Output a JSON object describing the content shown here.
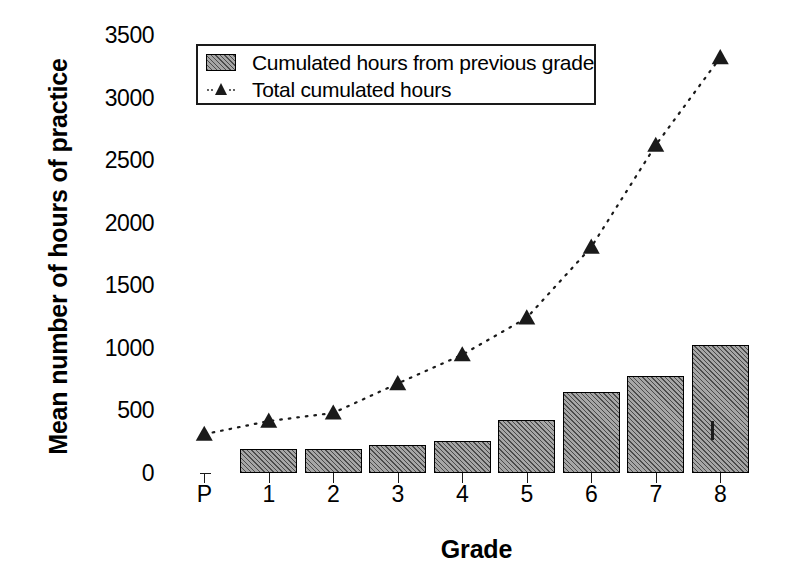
{
  "chart_data": {
    "type": "bar",
    "title": "",
    "xlabel": "Grade",
    "ylabel": "Mean number of hours of practice",
    "categories": [
      "P",
      "1",
      "2",
      "3",
      "4",
      "5",
      "6",
      "7",
      "8"
    ],
    "ylim": [
      0,
      3500
    ],
    "ytick_labels": [
      "0",
      "500",
      "1000",
      "1500",
      "2000",
      "2500",
      "3000",
      "3500"
    ],
    "ytick_values": [
      0,
      500,
      1000,
      1500,
      2000,
      2500,
      3000,
      3500
    ],
    "grid": false,
    "legend_position": "top-left inside plot",
    "series": [
      {
        "name": "Cumulated hours from previous grade",
        "kind": "bar",
        "values": [
          0,
          195,
          195,
          220,
          255,
          420,
          645,
          775,
          1025
        ]
      },
      {
        "name": "Total cumulated hours",
        "kind": "line-scatter-dotted",
        "marker": "triangle",
        "values": [
          310,
          415,
          480,
          715,
          945,
          1240,
          1805,
          2620,
          3320
        ]
      }
    ]
  },
  "legend": {
    "items": [
      {
        "label": "Cumulated hours from previous grade",
        "swatch": "hatched-bar-swatch"
      },
      {
        "label": "Total cumulated hours",
        "swatch": "dotted-triangle-swatch"
      }
    ]
  },
  "colors": {
    "bar_fill": "#a6a6a6",
    "bar_edge": "#000000",
    "line_marker": "#1a1a1a",
    "axis": "#1a1a1a",
    "background": "#ffffff"
  }
}
